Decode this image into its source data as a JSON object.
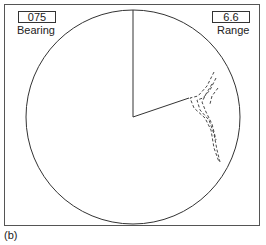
{
  "bearing": {
    "value": "075",
    "label": "Bearing"
  },
  "range": {
    "value": "6.6",
    "label": "Range"
  },
  "caption": "(b)",
  "display": {
    "type": "radar-ppi",
    "cursor_bearing_deg": 75,
    "line_color": "#333333"
  }
}
